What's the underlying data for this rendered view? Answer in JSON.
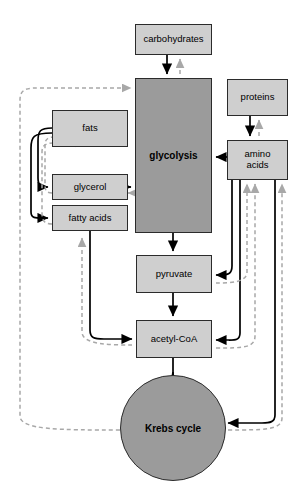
{
  "diagram": {
    "colors": {
      "light_box_fill": "#cfcfcf",
      "mid_box_fill": "#9b9b9b",
      "stroke": "#2b2b2b",
      "catabolic_arrow": "#000000",
      "anabolic_arrow": "#a8a8a8",
      "background": "#ffffff"
    },
    "nodes": [
      {
        "id": "carbohydrates",
        "label": "carbohydrates",
        "shape": "rect",
        "fill": "light",
        "bold": false,
        "x": 135,
        "y": 24,
        "w": 77,
        "h": 31,
        "font": 9.5
      },
      {
        "id": "glycolysis",
        "label": "glycolysis",
        "shape": "rect",
        "fill": "mid",
        "bold": true,
        "x": 135,
        "y": 78,
        "w": 77,
        "h": 155,
        "font": 10
      },
      {
        "id": "proteins",
        "label": "proteins",
        "shape": "rect",
        "fill": "light",
        "bold": false,
        "x": 227,
        "y": 79,
        "w": 61,
        "h": 37,
        "font": 9.5
      },
      {
        "id": "amino-acids",
        "label": "amino\nacids",
        "shape": "rect",
        "fill": "light",
        "bold": false,
        "x": 227,
        "y": 140,
        "w": 61,
        "h": 40,
        "font": 9.5
      },
      {
        "id": "fats",
        "label": "fats",
        "shape": "rect",
        "fill": "light",
        "bold": false,
        "x": 52,
        "y": 110,
        "w": 76,
        "h": 37,
        "font": 9.5
      },
      {
        "id": "glycerol",
        "label": "glycerol",
        "shape": "rect",
        "fill": "light",
        "bold": false,
        "x": 52,
        "y": 174,
        "w": 76,
        "h": 26,
        "font": 9.5
      },
      {
        "id": "fatty-acids",
        "label": "fatty acids",
        "shape": "rect",
        "fill": "light",
        "bold": false,
        "x": 52,
        "y": 205,
        "w": 76,
        "h": 26,
        "font": 9.5
      },
      {
        "id": "pyruvate",
        "label": "pyruvate",
        "shape": "rect",
        "fill": "light",
        "bold": false,
        "x": 136,
        "y": 255,
        "w": 76,
        "h": 38,
        "font": 9.5
      },
      {
        "id": "acetyl-coa",
        "label": "acetyl-CoA",
        "shape": "rect",
        "fill": "light",
        "bold": false,
        "x": 136,
        "y": 320,
        "w": 76,
        "h": 38,
        "font": 9.5
      },
      {
        "id": "krebs-cycle",
        "label": "Krebs cycle",
        "shape": "circle",
        "fill": "mid",
        "bold": true,
        "cx": 173,
        "cy": 428,
        "r": 53,
        "font": 10
      }
    ],
    "edges": [
      {
        "id": "carbohydrates-to-glycolysis",
        "from": "carbohydrates",
        "to": "glycolysis",
        "style": "solid",
        "direction": "down"
      },
      {
        "id": "glycolysis-to-carbohydrates",
        "from": "glycolysis",
        "to": "carbohydrates",
        "style": "dashed",
        "direction": "up"
      },
      {
        "id": "proteins-to-amino-acids",
        "from": "proteins",
        "to": "amino-acids",
        "style": "solid",
        "direction": "down"
      },
      {
        "id": "amino-acids-to-proteins",
        "from": "amino-acids",
        "to": "proteins",
        "style": "dashed",
        "direction": "up"
      },
      {
        "id": "amino-acids-to-glycolysis",
        "from": "amino-acids",
        "to": "glycolysis",
        "style": "solid",
        "direction": "left"
      },
      {
        "id": "fats-to-glycerol",
        "from": "fats",
        "to": "glycerol",
        "style": "solid",
        "direction": "down-left"
      },
      {
        "id": "fats-to-fatty-acids",
        "from": "fats",
        "to": "fatty-acids",
        "style": "solid",
        "direction": "down-left"
      },
      {
        "id": "glycerol-to-fats",
        "from": "glycerol",
        "to": "fats",
        "style": "dashed",
        "direction": "up-left"
      },
      {
        "id": "fatty-acids-to-fats",
        "from": "fatty-acids",
        "to": "fats",
        "style": "dashed",
        "direction": "up-left"
      },
      {
        "id": "glycerol-to-glycolysis",
        "from": "glycerol",
        "to": "glycolysis",
        "style": "solid",
        "direction": "right"
      },
      {
        "id": "glycolysis-to-glycerol",
        "from": "glycolysis",
        "to": "glycerol",
        "style": "dashed",
        "direction": "left"
      },
      {
        "id": "glycolysis-to-pyruvate",
        "from": "glycolysis",
        "to": "pyruvate",
        "style": "solid",
        "direction": "down"
      },
      {
        "id": "pyruvate-to-acetyl-coa",
        "from": "pyruvate",
        "to": "acetyl-coa",
        "style": "solid",
        "direction": "down"
      },
      {
        "id": "fatty-acids-to-acetyl-coa",
        "from": "fatty-acids",
        "to": "acetyl-coa",
        "style": "solid",
        "direction": "down-right"
      },
      {
        "id": "acetyl-coa-to-fatty-acids",
        "from": "acetyl-coa",
        "to": "fatty-acids",
        "style": "dashed",
        "direction": "up-left"
      },
      {
        "id": "acetyl-coa-to-krebs-cycle",
        "from": "acetyl-coa",
        "to": "krebs-cycle",
        "style": "solid",
        "direction": "down"
      },
      {
        "id": "amino-acids-to-pyruvate",
        "from": "amino-acids",
        "to": "pyruvate",
        "style": "solid",
        "direction": "left"
      },
      {
        "id": "pyruvate-to-amino-acids",
        "from": "pyruvate",
        "to": "amino-acids",
        "style": "dashed",
        "direction": "up"
      },
      {
        "id": "amino-acids-to-acetyl-coa",
        "from": "amino-acids",
        "to": "acetyl-coa",
        "style": "solid",
        "direction": "left"
      },
      {
        "id": "acetyl-coa-to-amino-acids",
        "from": "acetyl-coa",
        "to": "amino-acids",
        "style": "dashed",
        "direction": "up"
      },
      {
        "id": "amino-acids-to-krebs-cycle",
        "from": "amino-acids",
        "to": "krebs-cycle",
        "style": "solid",
        "direction": "down-left"
      },
      {
        "id": "krebs-cycle-to-amino-acids",
        "from": "krebs-cycle",
        "to": "amino-acids",
        "style": "dashed",
        "direction": "up"
      },
      {
        "id": "krebs-cycle-to-glycolysis",
        "from": "krebs-cycle",
        "to": "glycolysis",
        "style": "dashed",
        "direction": "left-up"
      }
    ],
    "legend": {
      "solid_meaning": "catabolic breakdown pathway",
      "dashed_meaning": "anabolic synthesis pathway"
    }
  }
}
